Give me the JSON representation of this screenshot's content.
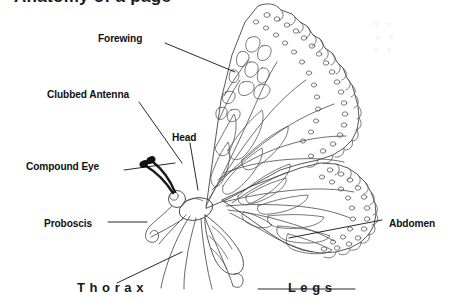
{
  "page": {
    "title_partial": "Anatomy of a page",
    "background_color": "#ffffff",
    "ink_color": "#111111",
    "width": 457,
    "height": 303
  },
  "diagram": {
    "labels": [
      {
        "id": "forewing",
        "text": "Forewing",
        "x": 98,
        "y": 33,
        "leader": {
          "x1": 165,
          "y1": 43,
          "x2": 235,
          "y2": 72
        }
      },
      {
        "id": "clubbed-antenna",
        "text": "Clubbed Antenna",
        "x": 47,
        "y": 89,
        "leader": {
          "x1": 139,
          "y1": 102,
          "x2": 182,
          "y2": 163
        }
      },
      {
        "id": "head",
        "text": "Head",
        "x": 172,
        "y": 132,
        "leader": {
          "x1": 190,
          "y1": 143,
          "x2": 198,
          "y2": 190
        }
      },
      {
        "id": "compound-eye",
        "text": "Compound Eye",
        "x": 26,
        "y": 161,
        "leader": {
          "x1": 124,
          "y1": 170,
          "x2": 175,
          "y2": 163
        }
      },
      {
        "id": "proboscis",
        "text": "Proboscis",
        "x": 44,
        "y": 218,
        "leader": {
          "x1": 108,
          "y1": 222,
          "x2": 147,
          "y2": 222
        }
      },
      {
        "id": "abdomen",
        "text": "Abdomen",
        "x": 389,
        "y": 218,
        "leader": {
          "x1": 289,
          "y1": 238,
          "x2": 382,
          "y2": 220
        }
      }
    ],
    "spaced_labels": [
      {
        "id": "thorax",
        "text": "T h o r a x",
        "x": 77,
        "y": 281,
        "leader": {
          "x1": 117,
          "y1": 283,
          "x2": 182,
          "y2": 252
        }
      },
      {
        "id": "legs",
        "text": "L e g s",
        "x": 288,
        "y": 281,
        "leader": {
          "x1": 258,
          "y1": 289,
          "x2": 355,
          "y2": 289
        }
      }
    ]
  }
}
